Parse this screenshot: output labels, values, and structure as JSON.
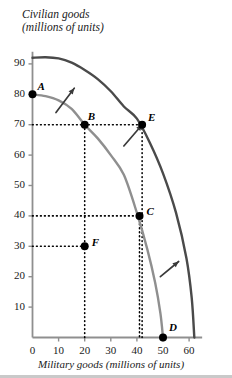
{
  "chart_data": {
    "type": "line",
    "title": "",
    "ylabel": "Civilian goods (millions of units)",
    "ylabel_line1": "Civilian goods",
    "ylabel_line2": "(millions of units)",
    "xlabel": "Military goods (millions of units)",
    "xlim": [
      0,
      65
    ],
    "ylim": [
      0,
      95
    ],
    "grid": false,
    "legend": "none",
    "xticks": [
      0,
      10,
      20,
      30,
      40,
      50,
      60
    ],
    "yticks": [
      10,
      20,
      30,
      40,
      50,
      60,
      70,
      80,
      90
    ],
    "series": [
      {
        "name": "inner-ppf",
        "color": "#8f8f8f",
        "x": [
          0,
          5,
          10,
          15,
          20,
          25,
          30,
          35,
          40,
          44,
          47,
          49,
          50
        ],
        "y": [
          80,
          79.4,
          78,
          75.2,
          70,
          65.5,
          60,
          53.5,
          41,
          29,
          18,
          8,
          0
        ]
      },
      {
        "name": "outer-ppf",
        "color": "#4a4a4a",
        "x": [
          0,
          5,
          10,
          15,
          20,
          25,
          30,
          35,
          40,
          45,
          50,
          55,
          59,
          61,
          62
        ],
        "y": [
          92,
          92.2,
          91.8,
          90.4,
          88,
          85,
          81,
          76,
          72,
          64,
          54,
          41,
          26,
          13,
          0
        ]
      }
    ],
    "points": [
      {
        "label": "A",
        "x": 0,
        "y": 80,
        "label_dx": 5,
        "label_dy": -14
      },
      {
        "label": "B",
        "x": 20,
        "y": 70,
        "label_dx": 3,
        "label_dy": -15
      },
      {
        "label": "E",
        "x": 42,
        "y": 70,
        "label_dx": 6,
        "label_dy": -14
      },
      {
        "label": "C",
        "x": 41,
        "y": 40,
        "label_dx": 7,
        "label_dy": -11
      },
      {
        "label": "F",
        "x": 20,
        "y": 30,
        "label_dx": 7,
        "label_dy": -10
      },
      {
        "label": "D",
        "x": 50,
        "y": 0,
        "label_dx": 6,
        "label_dy": -17
      }
    ],
    "dotted_guides": [
      {
        "from_x": 0,
        "from_y": 70,
        "to_x": 42,
        "to_y": 70
      },
      {
        "from_x": 0,
        "from_y": 40,
        "to_x": 41,
        "to_y": 40
      },
      {
        "from_x": 0,
        "from_y": 30,
        "to_x": 20,
        "to_y": 30
      },
      {
        "from_x": 20,
        "from_y": 70,
        "to_x": 20,
        "to_y": 0
      },
      {
        "from_x": 41,
        "from_y": 40,
        "to_x": 41,
        "to_y": 0
      },
      {
        "from_x": 42,
        "from_y": 70,
        "to_x": 42,
        "to_y": 0
      }
    ],
    "arrows": [
      {
        "name": "growth-arrow-upper-left",
        "from_x": 9,
        "from_y": 74,
        "to_x": 16,
        "to_y": 82
      },
      {
        "name": "growth-arrow-middle",
        "from_x": 35,
        "from_y": 63,
        "to_x": 42,
        "to_y": 70
      },
      {
        "name": "growth-arrow-lower-right",
        "from_x": 49,
        "from_y": 20,
        "to_x": 56,
        "to_y": 25
      }
    ],
    "axis_color": "#8f8f8f",
    "point_color": "#000000",
    "text_color": "#1a1a1a"
  }
}
